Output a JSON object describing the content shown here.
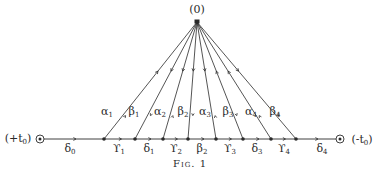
{
  "figure": {
    "caption": "Fig. 1",
    "apex": {
      "label": "(0)",
      "x": 197,
      "y": 22
    },
    "baseline_y": 139,
    "left_end": {
      "label": "(+t",
      "sub": "0",
      "close": ")",
      "x": 40
    },
    "right_end": {
      "label": "(-t",
      "sub": "0",
      "close": ")",
      "x": 340
    },
    "nodes_x": [
      104,
      135,
      163,
      188,
      216,
      243,
      271,
      296
    ],
    "ray_labels": [
      {
        "sym": "α",
        "sub": "1",
        "x": 107,
        "y": 106
      },
      {
        "sym": "β",
        "sub": "1",
        "x": 134,
        "y": 106
      },
      {
        "sym": "α",
        "sub": "2",
        "x": 160,
        "y": 106
      },
      {
        "sym": "β",
        "sub": "2",
        "x": 183,
        "y": 106
      },
      {
        "sym": "α",
        "sub": "3",
        "x": 205,
        "y": 106
      },
      {
        "sym": "β",
        "sub": "3",
        "x": 228,
        "y": 106
      },
      {
        "sym": "α",
        "sub": "4",
        "x": 251,
        "y": 106
      },
      {
        "sym": "β",
        "sub": "4",
        "x": 275,
        "y": 106
      }
    ],
    "segment_labels": [
      {
        "sym": "δ",
        "sub": "0",
        "x": 70
      },
      {
        "sym": "ϒ",
        "sub": "1",
        "x": 119
      },
      {
        "sym": "δ",
        "sub": "1",
        "x": 149
      },
      {
        "sym": "ϒ",
        "sub": "2",
        "x": 176
      },
      {
        "sym": "β",
        "sub": "2",
        "x": 202
      },
      {
        "sym": "ϒ",
        "sub": "3",
        "x": 230
      },
      {
        "sym": "δ",
        "sub": "3",
        "x": 257
      },
      {
        "sym": "ϒ",
        "sub": "4",
        "x": 284
      },
      {
        "sym": "δ",
        "sub": "4",
        "x": 322
      }
    ],
    "colors": {
      "ink": "#2a2a2a",
      "background": "#ffffff"
    }
  }
}
